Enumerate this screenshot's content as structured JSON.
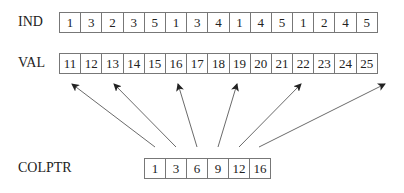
{
  "diagram": {
    "ind": {
      "label": "IND",
      "values": [
        "1",
        "3",
        "2",
        "3",
        "5",
        "1",
        "3",
        "4",
        "1",
        "4",
        "5",
        "1",
        "2",
        "4",
        "5"
      ]
    },
    "val": {
      "label": "VAL",
      "values": [
        "11",
        "12",
        "13",
        "14",
        "15",
        "16",
        "17",
        "18",
        "19",
        "20",
        "21",
        "22",
        "23",
        "24",
        "25"
      ]
    },
    "colptr": {
      "label": "COLPTR",
      "values": [
        "1",
        "3",
        "6",
        "9",
        "12",
        "16"
      ]
    },
    "arrows": [
      {
        "from": "colptr.0",
        "to": "val.0"
      },
      {
        "from": "colptr.1",
        "to": "val.2"
      },
      {
        "from": "colptr.2",
        "to": "val.5"
      },
      {
        "from": "colptr.3",
        "to": "val.8"
      },
      {
        "from": "colptr.4",
        "to": "val.11"
      },
      {
        "from": "colptr.5",
        "to": "val.15"
      }
    ]
  }
}
